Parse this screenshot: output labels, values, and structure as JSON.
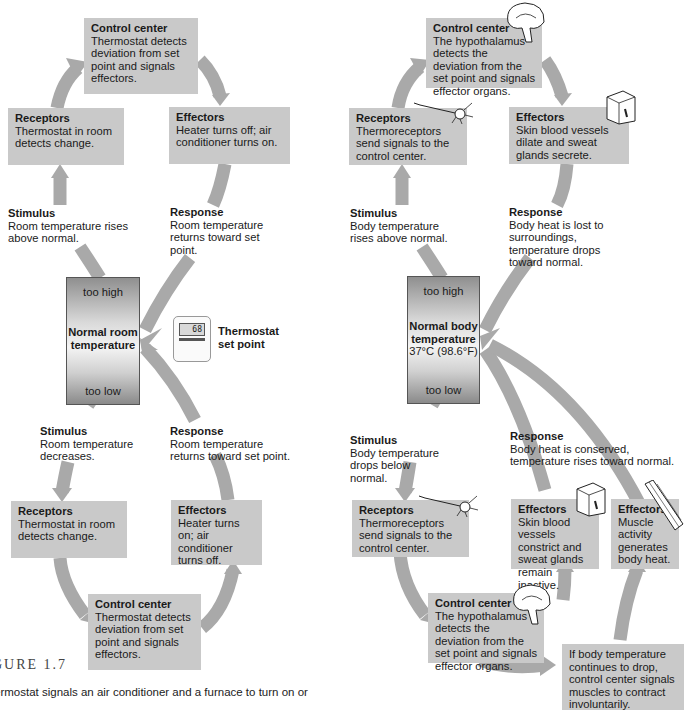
{
  "left_loop": {
    "top": {
      "control_center": {
        "title": "Control center",
        "text": "Thermostat detects deviation from set point and signals effectors."
      },
      "receptors": {
        "title": "Receptors",
        "text": "Thermostat in room detects change."
      },
      "effectors": {
        "title": "Effectors",
        "text": "Heater turns off; air conditioner turns on."
      },
      "stimulus": {
        "title": "Stimulus",
        "text": "Room temperature rises above normal."
      },
      "response": {
        "title": "Response",
        "text": "Room temperature returns toward set point."
      }
    },
    "center": {
      "too_high": "too high",
      "title_line1": "Normal room",
      "title_line2": "temperature",
      "too_low": "too low"
    },
    "set_point": {
      "device_display": "68",
      "label_line1": "Thermostat",
      "label_line2": "set point"
    },
    "bottom": {
      "stimulus": {
        "title": "Stimulus",
        "text": "Room temperature decreases."
      },
      "response": {
        "title": "Response",
        "text": "Room temperature returns toward set point."
      },
      "receptors": {
        "title": "Receptors",
        "text": "Thermostat in room detects change."
      },
      "effectors": {
        "title": "Effectors",
        "text": "Heater turns on; air conditioner turns off."
      },
      "control_center": {
        "title": "Control center",
        "text": "Thermostat detects deviation from set point and signals effectors."
      }
    }
  },
  "right_loop": {
    "top": {
      "control_center": {
        "title": "Control center",
        "text": "The hypothalamus detects the deviation from the set point and signals effector organs."
      },
      "receptors": {
        "title": "Receptors",
        "text": "Thermoreceptors send signals to the control center."
      },
      "effectors": {
        "title": "Effectors",
        "text": "Skin blood vessels dilate and sweat glands secrete."
      },
      "stimulus": {
        "title": "Stimulus",
        "text": "Body temperature rises above normal."
      },
      "response": {
        "title": "Response",
        "text": "Body heat is lost to surroundings, temperature drops toward normal."
      }
    },
    "center": {
      "too_high": "too high",
      "title_line1": "Normal body",
      "title_line2": "temperature",
      "value": "37°C (98.6°F)",
      "too_low": "too low"
    },
    "bottom": {
      "stimulus": {
        "title": "Stimulus",
        "text": "Body temperature drops below normal."
      },
      "response": {
        "title": "Response",
        "text": "Body heat is conserved, temperature rises toward normal."
      },
      "receptors": {
        "title": "Receptors",
        "text": "Thermoreceptors send signals to the control center."
      },
      "effectors_skin": {
        "title": "Effectors",
        "text": "Skin blood vessels constrict and sweat glands remain inactive."
      },
      "effectors_muscle": {
        "title": "Effectors",
        "text": "Muscle activity generates body heat."
      },
      "control_center": {
        "title": "Control center",
        "text": "The hypothalamus detects the deviation from the set point and signals effector organs."
      },
      "note": "If body temperature continues to drop, control center signals muscles to contract involuntarily."
    }
  },
  "caption": {
    "figure": "GURE 1.7",
    "text": "ermostat signals an air conditioner and a furnace to turn on or"
  },
  "colors": {
    "box": "#c9c9c9",
    "arrow": "#a8a8a8",
    "text": "#1a1a1a"
  }
}
